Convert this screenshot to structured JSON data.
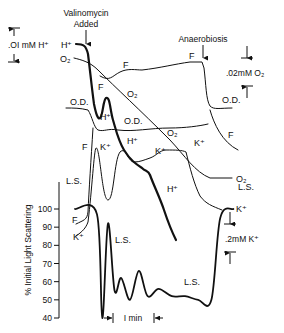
{
  "chart_data": {
    "type": "line",
    "title": "",
    "annotations": {
      "valinomycin": "Valinomycin\nAdded",
      "valinomycin_line1": "Valinomycin",
      "valinomycin_line2": "Added",
      "anaerobiosis": "Anaerobiosis",
      "time_scale": "I min",
      "scale_h": ".OI mM H⁺",
      "scale_o2": ".02mM O₂",
      "scale_k": ".2mM K⁺"
    },
    "ylabel": "% Initial Light Scattering",
    "yticks": [
      100,
      90,
      80,
      70,
      60,
      50,
      40
    ],
    "ylim": [
      40,
      100
    ],
    "trace_labels": {
      "H": "H⁺",
      "O2": "O₂",
      "F": "F",
      "OD": "O.D.",
      "K": "K⁺",
      "LS": "L.S."
    },
    "series": [
      {
        "name": "H+",
        "x": [
          0,
          0.3,
          0.45,
          0.6,
          0.8,
          1.0,
          1.15,
          1.3,
          1.5,
          1.8,
          2.1,
          2.4,
          2.7,
          3.0,
          3.3
        ],
        "y_rel": [
          1.0,
          0.98,
          0.9,
          0.55,
          0.5,
          0.62,
          0.52,
          0.42,
          0.4,
          0.33,
          0.3,
          0.2,
          0.1,
          0.0,
          -0.05
        ]
      },
      {
        "name": "O2",
        "x": [
          0,
          0.4,
          0.8,
          1.4,
          2.0,
          2.6,
          3.0,
          3.6,
          4.2
        ],
        "y_rel": [
          1.0,
          0.93,
          0.82,
          0.68,
          0.55,
          0.42,
          0.35,
          0.34,
          0.34
        ]
      },
      {
        "name": "F (upper)",
        "x": [
          0.6,
          0.9,
          1.2,
          1.6,
          2.2,
          2.8,
          3.2,
          3.3,
          3.5,
          4.0
        ],
        "y_rel": [
          0.6,
          0.7,
          0.72,
          0.8,
          0.86,
          0.9,
          0.92,
          0.4,
          0.2,
          0.1
        ]
      },
      {
        "name": "O.D.",
        "x": [
          0,
          0.4,
          0.6,
          0.9,
          1.4,
          2.0,
          2.8,
          3.3,
          3.5,
          4.0
        ],
        "y_rel": [
          0.5,
          0.5,
          0.35,
          0.33,
          0.36,
          0.38,
          0.4,
          0.42,
          0.6,
          0.62
        ]
      },
      {
        "name": "K+",
        "x": [
          0,
          0.5,
          0.6,
          0.75,
          0.9,
          1.2,
          1.5,
          1.8,
          2.2,
          2.6,
          3.0,
          3.3,
          3.6,
          4.0
        ],
        "y_rel": [
          0.1,
          0.15,
          0.9,
          0.95,
          0.3,
          0.6,
          0.45,
          0.55,
          0.58,
          0.6,
          0.4,
          0.2,
          0.15,
          0.12
        ]
      },
      {
        "name": "L.S. (% initial)",
        "x": [
          0,
          0.5,
          0.62,
          0.75,
          0.9,
          1.05,
          1.25,
          1.45,
          1.65,
          1.9,
          2.2,
          2.5,
          2.8,
          3.1,
          3.3,
          3.6
        ],
        "y": [
          100,
          97,
          40,
          92,
          55,
          62,
          50,
          66,
          52,
          56,
          52,
          52,
          50,
          50,
          95,
          100
        ]
      }
    ],
    "grid": false,
    "legend": "inline labels"
  }
}
